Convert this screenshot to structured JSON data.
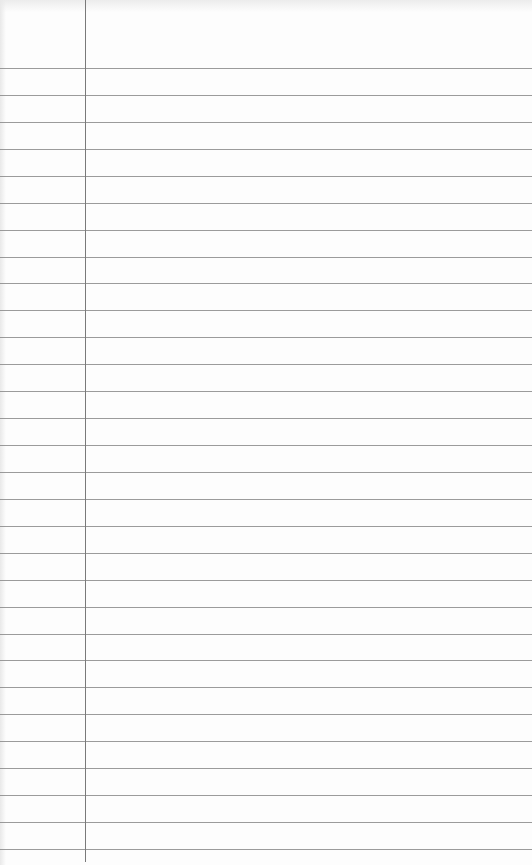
{
  "page": {
    "type": "ruled notebook paper",
    "background_color": "#fdfdfd",
    "rule_color": "#8a8a8a",
    "margin_line_color": "#7a7a7a"
  },
  "rules": {
    "count": 30,
    "first_y": 68,
    "spacing": 26.93
  },
  "margin": {
    "x": 85
  }
}
